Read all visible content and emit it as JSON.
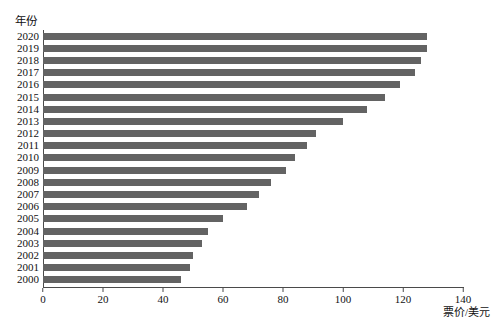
{
  "figure": {
    "clipped_top_text": "· · ·",
    "y_axis_title": "年份",
    "x_axis_title": "票价/美元",
    "bar_color": "#636363",
    "axis_color": "#4a4a4a",
    "background": "#ffffff"
  },
  "chart_data": {
    "type": "bar",
    "orientation": "horizontal",
    "title": "",
    "xlabel": "票价/美元",
    "ylabel": "年份",
    "xlim": [
      0,
      140
    ],
    "xticks": [
      0,
      20,
      40,
      60,
      80,
      100,
      120,
      140
    ],
    "grid": false,
    "legend": null,
    "categories": [
      "2020",
      "2019",
      "2018",
      "2017",
      "2016",
      "2015",
      "2014",
      "2013",
      "2012",
      "2011",
      "2010",
      "2009",
      "2008",
      "2007",
      "2006",
      "2005",
      "2004",
      "2003",
      "2002",
      "2001",
      "2000"
    ],
    "values": [
      128,
      128,
      126,
      124,
      119,
      114,
      108,
      100,
      91,
      88,
      84,
      81,
      76,
      72,
      68,
      60,
      55,
      53,
      50,
      49,
      46
    ],
    "series": [
      {
        "name": "票价/美元",
        "color": "#636363",
        "values": [
          128,
          128,
          126,
          124,
          119,
          114,
          108,
          100,
          91,
          88,
          84,
          81,
          76,
          72,
          68,
          60,
          55,
          53,
          50,
          49,
          46
        ]
      }
    ]
  }
}
